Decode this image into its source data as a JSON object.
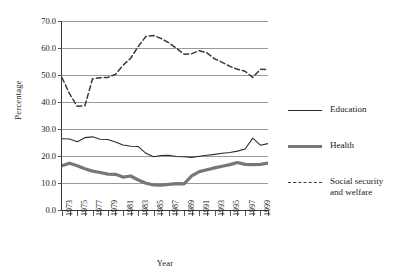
{
  "chart_data": {
    "type": "line",
    "title": "",
    "xlabel": "Year",
    "ylabel": "Percentage",
    "ylim": [
      0,
      70
    ],
    "ytick_step": 10,
    "ytick_labels": [
      "70.0",
      "60.0",
      "50.0",
      "40.0",
      "30.0",
      "20.0",
      "10.0",
      "0.0"
    ],
    "ytick_values": [
      70,
      60,
      50,
      40,
      30,
      20,
      10,
      0
    ],
    "grid": true,
    "legend_position": "right",
    "x": [
      1973,
      1974,
      1975,
      1976,
      1977,
      1978,
      1979,
      1980,
      1981,
      1982,
      1983,
      1984,
      1985,
      1986,
      1987,
      1988,
      1989,
      1990,
      1991,
      1992,
      1993,
      1994,
      1995,
      1996,
      1997,
      1998,
      1999,
      2000
    ],
    "xtick_labels": [
      "1973",
      "1975",
      "1977",
      "1979",
      "1981",
      "1983",
      "1985",
      "1987",
      "1989",
      "1991",
      "1993",
      "1995",
      "1997",
      "1999"
    ],
    "xlim": [
      1973,
      2000
    ],
    "series": [
      {
        "name": "Education",
        "style": "solid-thin",
        "color": "#2b2b2b",
        "values": [
          26.4,
          26.3,
          25.3,
          26.8,
          27.1,
          26.2,
          26.1,
          25.2,
          24.1,
          23.6,
          23.5,
          21.0,
          19.7,
          20.2,
          20.3,
          19.8,
          19.7,
          19.5,
          19.9,
          20.3,
          20.6,
          21.0,
          21.3,
          21.8,
          22.6,
          26.6,
          24.0,
          24.6
        ]
      },
      {
        "name": "Health",
        "style": "solid-thick",
        "color": "#777777",
        "values": [
          16.4,
          17.3,
          16.4,
          15.3,
          14.4,
          13.9,
          13.3,
          13.2,
          12.2,
          12.6,
          11.1,
          9.9,
          9.3,
          9.2,
          9.5,
          9.8,
          9.7,
          12.6,
          14.2,
          14.9,
          15.6,
          16.2,
          16.8,
          17.6,
          16.9,
          16.8,
          16.9,
          17.4
        ]
      },
      {
        "name": "Social security and welfare",
        "style": "dashed",
        "color": "#3a3a3a",
        "values": [
          49.0,
          43.0,
          38.4,
          38.6,
          48.6,
          49.0,
          49.1,
          50.2,
          53.6,
          56.2,
          60.6,
          64.3,
          64.6,
          63.5,
          61.9,
          59.9,
          57.7,
          57.9,
          59.0,
          58.2,
          56.0,
          54.7,
          53.2,
          52.1,
          51.4,
          49.1,
          52.1,
          52.0
        ]
      }
    ]
  },
  "legend": {
    "items": [
      {
        "label": "Education"
      },
      {
        "label": "Health"
      },
      {
        "label": "Social security\nand welfare"
      }
    ]
  }
}
